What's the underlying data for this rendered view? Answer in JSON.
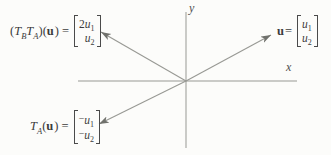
{
  "axes": {
    "x_label": "x",
    "y_label": "y"
  },
  "labels": {
    "tbta": {
      "p1": "(",
      "T1": "T",
      "s1": "B",
      "T2": "T",
      "s2": "A",
      "p2": ")(",
      "u": "u",
      "p3": ") =",
      "matrix": {
        "r1": {
          "c": "2",
          "v": "u",
          "s": "1"
        },
        "r2": {
          "c": "",
          "v": "u",
          "s": "2"
        }
      }
    },
    "u": {
      "u": "u",
      "eq": "=",
      "matrix": {
        "r1": {
          "c": "",
          "v": "u",
          "s": "1"
        },
        "r2": {
          "c": "",
          "v": "u",
          "s": "2"
        }
      }
    },
    "ta": {
      "T1": "T",
      "s1": "A",
      "p1": "(",
      "u": "u",
      "p2": ") =",
      "matrix": {
        "r1": {
          "c": "−",
          "v": "u",
          "s": "1"
        },
        "r2": {
          "c": "−",
          "v": "u",
          "s": "2"
        }
      }
    }
  },
  "colors": {
    "line": "#989994",
    "arrow": "#70716c",
    "text": "#3b3b3b",
    "background": "#fcfcfa"
  }
}
